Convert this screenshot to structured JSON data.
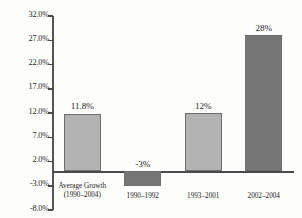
{
  "chart_data": {
    "type": "bar",
    "title": "",
    "subtitle": "",
    "xlabel": "",
    "ylabel": "",
    "categories": [
      "Average Growth\n(1990–2004)",
      "1990–1992",
      "1993–2001",
      "2002–2004"
    ],
    "category_lines": [
      [
        "Average Growth",
        "(1990–2004)"
      ],
      [
        "1990–1992"
      ],
      [
        "1993–2001"
      ],
      [
        "2002–2004"
      ]
    ],
    "values": [
      11.8,
      -3,
      12,
      28
    ],
    "value_labels": [
      "11.8%",
      "-3%",
      "12%",
      "28%"
    ],
    "bar_styles": [
      "light",
      "dark",
      "light",
      "dark"
    ],
    "ylim": [
      -8,
      32
    ],
    "ytick_values": [
      32,
      27,
      22,
      17,
      12,
      7,
      2,
      -3,
      -8
    ],
    "ytick_labels": [
      "32.0%",
      "27.0%",
      "22.0%",
      "17.0%",
      "12.0%",
      "7.0%",
      "2.0%",
      "-3.0%",
      "-8.0%"
    ],
    "grid": false,
    "legend": false,
    "legend_position": "none",
    "zero_line": true,
    "colors": {
      "bar_light": "#b3b3b3",
      "bar_dark": "#767676",
      "bar_border": "#6e6e6e",
      "axis": "#4a4a4a",
      "text": "#1f1f1f",
      "background": "#fdfdfc"
    }
  }
}
